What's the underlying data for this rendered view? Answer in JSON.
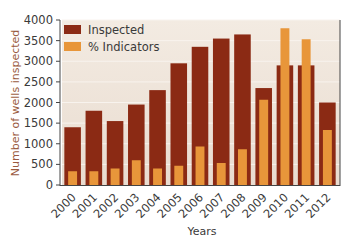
{
  "chart_data": {
    "type": "bar",
    "title": "",
    "xlabel": "Years",
    "ylabel": "Number of wells inspected",
    "ylabel_right": "Percentage of wells from each year with integrity issues",
    "ylim": [
      0,
      4000
    ],
    "ylim_right": [
      0,
      6
    ],
    "yticks": [
      0,
      500,
      1000,
      1500,
      2000,
      2500,
      3000,
      3500,
      4000
    ],
    "yticks_right": [
      0,
      1,
      2,
      3,
      4,
      5,
      6
    ],
    "categories": [
      "2000",
      "2001",
      "2002",
      "2003",
      "2004",
      "2005",
      "2006",
      "2007",
      "2008",
      "2009",
      "2010",
      "2011",
      "2012"
    ],
    "series": [
      {
        "name": "Inspected",
        "axis": "left",
        "color": "#8b2a14",
        "values": [
          1400,
          1800,
          1550,
          1950,
          2300,
          2950,
          3350,
          3550,
          3650,
          2350,
          2900,
          2900,
          2000
        ]
      },
      {
        "name": "% Indicators",
        "axis": "right",
        "color": "#e8963a",
        "values": [
          0.5,
          0.5,
          0.6,
          0.9,
          0.6,
          0.7,
          1.4,
          0.8,
          1.3,
          3.1,
          5.7,
          5.3,
          2.0
        ]
      }
    ],
    "legend": {
      "position": "top-left",
      "entries": [
        "Inspected",
        "% Indicators"
      ]
    },
    "grid": {
      "horizontal": true,
      "vertical": false
    },
    "plot_background": "#efe4da"
  }
}
